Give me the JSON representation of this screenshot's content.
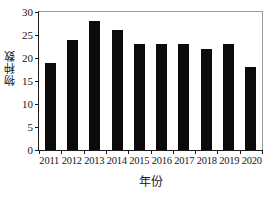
{
  "chart_data": {
    "type": "bar",
    "title": "",
    "xlabel": "年份",
    "ylabel": "物种数",
    "categories": [
      "2011",
      "2012",
      "2013",
      "2014",
      "2015",
      "2016",
      "2017",
      "2018",
      "2019",
      "2020"
    ],
    "values": [
      19,
      24,
      28,
      26,
      23,
      23,
      23,
      22,
      23,
      18
    ],
    "series": [
      {
        "name": "物种数",
        "values": [
          19,
          24,
          28,
          26,
          23,
          23,
          23,
          22,
          23,
          18
        ]
      }
    ],
    "ylim": [
      0,
      30
    ],
    "yticks": [
      0,
      5,
      10,
      15,
      20,
      25,
      30
    ],
    "ytick_labels": [
      "0",
      "5",
      "10",
      "15",
      "20",
      "25",
      "30"
    ],
    "xtick_labels": [
      "2011",
      "2012",
      "2013",
      "2014",
      "2015",
      "2016",
      "2017",
      "2018",
      "2019",
      "2020"
    ],
    "grid": false,
    "legend": "none",
    "bar_color": "#0b0b0b",
    "axis_color": "#1a1a1a",
    "frame_color": "#9a9a9a",
    "background": "#ffffff"
  }
}
